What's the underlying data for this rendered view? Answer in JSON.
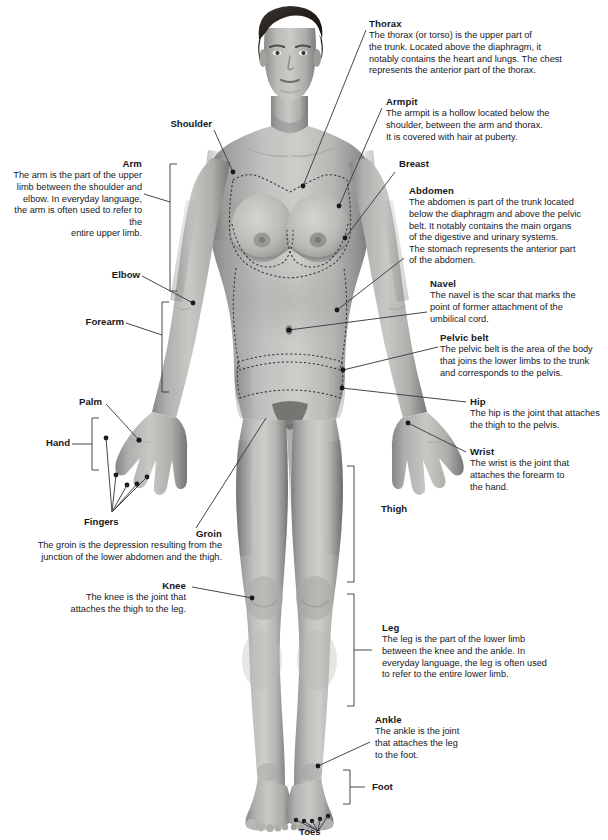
{
  "diagram": {
    "figure_alt": "Full-length front view photograph of a standing nude female figure in grayscale, with dashed outlines marking the thorax, breast, abdomen and pelvic belt regions",
    "line_color": "#3c3c46",
    "text_color": "#17171c",
    "background": "#ffffff"
  },
  "callouts": [
    {
      "id": "thorax",
      "title": "Thorax",
      "body": "The thorax (or torso) is the upper part of\nthe trunk. Located above the diaphragm, it\nnotably contains the heart and lungs. The chest\nrepresents the anterior part of the thorax."
    },
    {
      "id": "armpit",
      "title": "Armpit",
      "body": "The armpit is a hollow located below the\nshoulder, between the arm and thorax.\nIt is covered with hair at puberty."
    },
    {
      "id": "breast",
      "title": "Breast",
      "body": ""
    },
    {
      "id": "abdomen",
      "title": "Abdomen",
      "body": "The abdomen is part of the trunk located\nbelow the diaphragm and above the pelvic\nbelt. It notably contains the main organs\nof the digestive and urinary systems.\nThe stomach represents the anterior part\nof the abdomen."
    },
    {
      "id": "navel",
      "title": "Navel",
      "body": "The navel is the scar that marks the\npoint of former attachment of the\numbilical cord."
    },
    {
      "id": "pelvic-belt",
      "title": "Pelvic belt",
      "body": "The pelvic belt is the area of the body\nthat joins the lower limbs to the trunk\nand corresponds to the pelvis."
    },
    {
      "id": "hip",
      "title": "Hip",
      "body": "The hip is the joint that attaches\nthe thigh to the pelvis."
    },
    {
      "id": "wrist",
      "title": "Wrist",
      "body": "The wrist is the joint that\nattaches the forearm to\nthe hand."
    },
    {
      "id": "thigh",
      "title": "Thigh",
      "body": ""
    },
    {
      "id": "leg",
      "title": "Leg",
      "body": "The leg is the part of the lower limb\nbetween the knee and the ankle. In\neveryday language, the leg is often used\nto refer to the entire lower limb."
    },
    {
      "id": "ankle",
      "title": "Ankle",
      "body": "The ankle is the joint\nthat attaches the leg\nto the foot."
    },
    {
      "id": "foot",
      "title": "Foot",
      "body": ""
    },
    {
      "id": "toes",
      "title": "Toes",
      "body": ""
    },
    {
      "id": "shoulder",
      "title": "Shoulder",
      "body": ""
    },
    {
      "id": "arm",
      "title": "Arm",
      "body": "The arm is the part of the upper\nlimb between the shoulder and\nelbow. In everyday language,\nthe arm is often used to refer to the\nentire upper limb."
    },
    {
      "id": "elbow",
      "title": "Elbow",
      "body": ""
    },
    {
      "id": "forearm",
      "title": "Forearm",
      "body": ""
    },
    {
      "id": "palm",
      "title": "Palm",
      "body": ""
    },
    {
      "id": "hand",
      "title": "Hand",
      "body": ""
    },
    {
      "id": "fingers",
      "title": "Fingers",
      "body": ""
    },
    {
      "id": "groin",
      "title": "Groin",
      "body": "The groin is the depression resulting from the\njunction of the lower abdomen and the thigh."
    },
    {
      "id": "knee",
      "title": "Knee",
      "body": "The knee is the joint that\nattaches the thigh to the leg."
    }
  ]
}
